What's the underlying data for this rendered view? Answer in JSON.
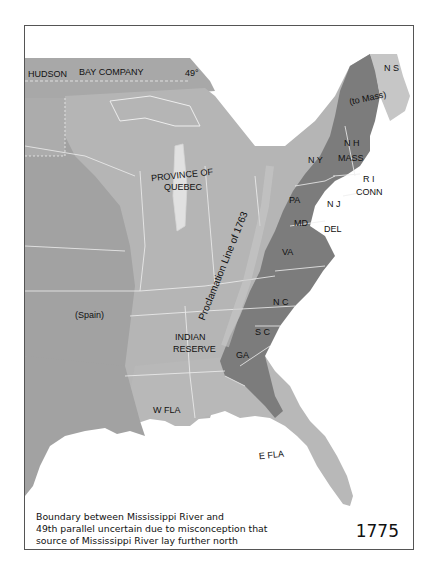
{
  "map": {
    "year": "1775",
    "caption_lines": [
      "Boundary between Mississippi River and",
      "49th parallel uncertain due to misconception that",
      "source of Mississippi River lay further north"
    ],
    "colors": {
      "colonies": "#7c7c7c",
      "quebec_reserve": "#b5b5b5",
      "spain_hudson": "#a2a2a2",
      "nova_scotia": "#c6c6c6",
      "water": "#ffffff",
      "borders": "#e8e8e8"
    },
    "labels": {
      "hudson": "HUDSON",
      "bay_company": "BAY COMPANY",
      "parallel": "49°",
      "ns": "N S",
      "to_mass": "(to Mass)",
      "nh": "N H",
      "ny": "N Y",
      "mass": "MASS",
      "ri": "R I",
      "conn": "CONN",
      "province_of": "PROVINCE OF",
      "quebec": "QUEBEC",
      "pa": "PA",
      "nj": "N J",
      "md": "MD",
      "del": "DEL",
      "va": "VA",
      "nc": "N C",
      "sc": "S C",
      "ga": "GA",
      "proclamation": "Proclamation Line of 1763",
      "spain": "(Spain)",
      "indian": "INDIAN",
      "reserve": "RESERVE",
      "wfla": "W FLA",
      "efla": "E FLA"
    }
  }
}
